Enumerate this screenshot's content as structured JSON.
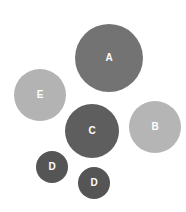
{
  "diagram": {
    "nodes": [
      {
        "id": "A",
        "label": "A",
        "cx": 109,
        "cy": 58,
        "r": 34,
        "color": "#737373"
      },
      {
        "id": "E",
        "label": "E",
        "cx": 40,
        "cy": 95,
        "r": 26,
        "color": "#b3b3b3"
      },
      {
        "id": "C",
        "label": "C",
        "cx": 92,
        "cy": 131,
        "r": 27,
        "color": "#5e5e5e"
      },
      {
        "id": "B",
        "label": "B",
        "cx": 155,
        "cy": 127,
        "r": 26,
        "color": "#b5b5b5"
      },
      {
        "id": "D1",
        "label": "D",
        "cx": 52,
        "cy": 167,
        "r": 16,
        "color": "#555555"
      },
      {
        "id": "D2",
        "label": "D",
        "cx": 94,
        "cy": 183,
        "r": 16,
        "color": "#555555"
      }
    ]
  }
}
